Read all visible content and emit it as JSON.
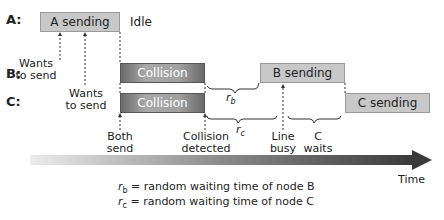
{
  "nodes": {
    "a_label": "A:",
    "b_label": "B:",
    "c_label": "C:"
  },
  "boxes": {
    "a_sending": "A sending",
    "b_collision": "Collision",
    "c_collision": "Collision",
    "b_sending": "B sending",
    "c_sending": "C sending"
  },
  "annotations": {
    "idle": "Idle",
    "b_wants_1": "Wants",
    "b_wants_2": "to send",
    "c_wants_1": "Wants",
    "c_wants_2": "to send",
    "both_1": "Both",
    "both_2": "send",
    "coll_1": "Collision",
    "coll_2": "detected",
    "line_1": "Line",
    "line_2": "busy",
    "cwait_1": "C",
    "cwait_2": "waits",
    "rb": "r",
    "rb_sub": "b",
    "rc": "r",
    "rc_sub": "c"
  },
  "axis": {
    "label": "Time"
  },
  "legend": {
    "rb_sym": "r",
    "rb_sub": "b",
    "rb_text": " = random waiting time of node B",
    "rc_sym": "r",
    "rc_sub": "c",
    "rc_text": " = random waiting time of node C"
  },
  "colors": {
    "light_box": "#c8c8c8",
    "dark_box": "#8a8a8a",
    "arrow_start": "#e8e8e8",
    "arrow_end": "#3a3a3a"
  }
}
